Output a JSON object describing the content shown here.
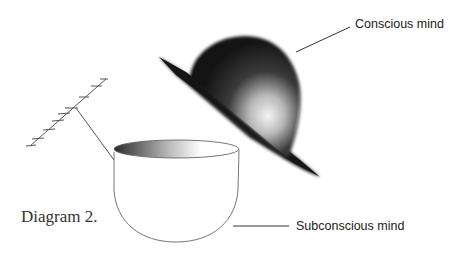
{
  "diagram": {
    "caption": "Diagram 2.",
    "labels": {
      "hat": "Conscious mind",
      "bowl": "Subconscious mind"
    },
    "elements": [
      {
        "id": "bowler-hat",
        "represents": "Conscious mind"
      },
      {
        "id": "bowl",
        "represents": "Subconscious mind"
      },
      {
        "id": "antenna",
        "connected_to": "bowl"
      }
    ],
    "colors": {
      "background": "#ffffff",
      "hat_dark": "#1a1a1a",
      "hat_highlight": "#f2f2f2",
      "line": "#444444",
      "text": "#222222"
    }
  }
}
